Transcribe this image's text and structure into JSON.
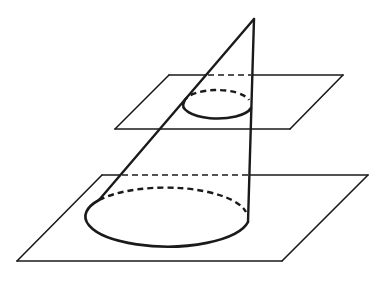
{
  "diagram": {
    "colors": {
      "stroke": "#1a1a1a",
      "background": "#ffffff"
    },
    "apex": {
      "x": 254,
      "y": 19
    },
    "upper_plane": {
      "points": [
        [
          169,
          75
        ],
        [
          343,
          75
        ],
        [
          290,
          129
        ],
        [
          115,
          129
        ]
      ],
      "hidden_segment": {
        "x1": 206,
        "x2": 253,
        "y": 75
      }
    },
    "lower_plane": {
      "points": [
        [
          102,
          175
        ],
        [
          368,
          175
        ],
        [
          282,
          261
        ],
        [
          17,
          261
        ]
      ],
      "hidden_segment": {
        "x1": 120,
        "x2": 250,
        "y": 175
      }
    },
    "small_section": {
      "cx": 216,
      "cy": 105,
      "rx": 33,
      "ry": 13
    },
    "base_ellipse": {
      "cx": 166,
      "cy": 220,
      "rx": 82,
      "ry": 30
    },
    "generators": {
      "left": {
        "x1": 254,
        "y1": 19,
        "x2": 99,
        "y2": 200
      },
      "right": {
        "x1": 254,
        "y1": 19,
        "x2": 248,
        "y2": 222
      }
    }
  }
}
